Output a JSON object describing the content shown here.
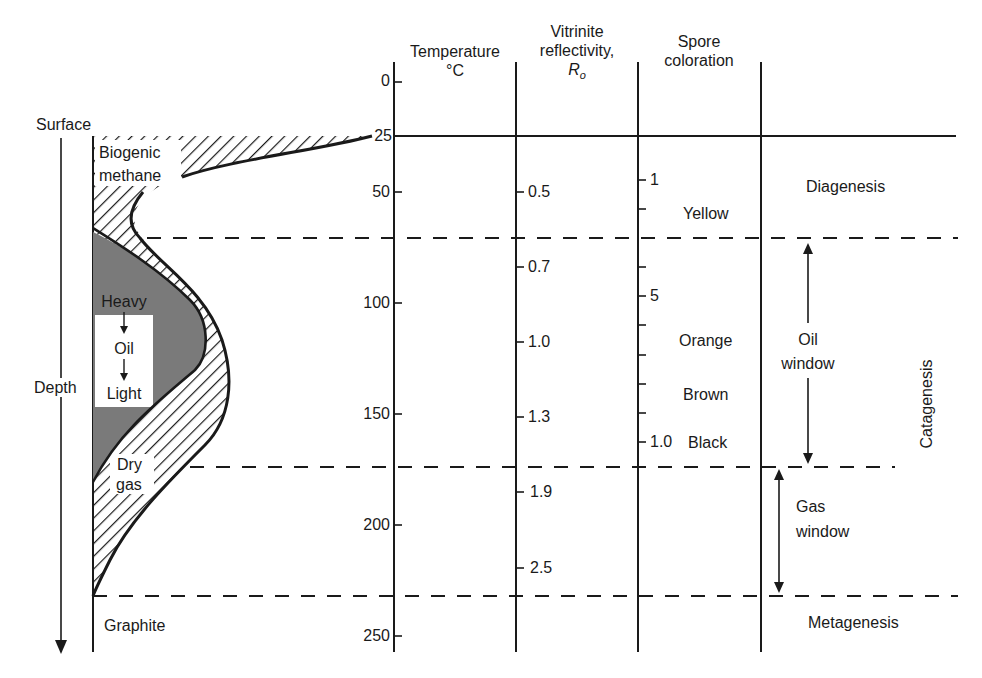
{
  "left_panel": {
    "surface_label": "Surface",
    "depth_label": "Depth",
    "biogenic_label": [
      "Biogenic",
      "methane"
    ],
    "oil_labels": [
      "Heavy",
      "Oil",
      "Light"
    ],
    "dry_gas_label": [
      "Dry",
      "gas"
    ],
    "graphite_label": "Graphite"
  },
  "columns": {
    "temperature": {
      "header": "Temperature",
      "unit": "°C"
    },
    "vitrinite": {
      "header_line1": "Vitrinite",
      "header_line2": "reflectivity,",
      "symbol": "R",
      "subscript": "o"
    },
    "spore": {
      "header_line1": "Spore",
      "header_line2": "coloration"
    }
  },
  "temperature_ticks": [
    "0",
    "25",
    "50",
    "100",
    "150",
    "200",
    "250"
  ],
  "vitrinite_ticks": [
    "0.5",
    "0.7",
    "1.0",
    "1.3",
    "1.9",
    "2.5"
  ],
  "spore_ticks": [
    "1",
    "5",
    "1.0"
  ],
  "spore_colors": [
    "Yellow",
    "Orange",
    "Brown",
    "Black"
  ],
  "zones": {
    "diagenesis": "Diagenesis",
    "oil_window": [
      "Oil",
      "window"
    ],
    "catagenesis": "Catagenesis",
    "gas_window": [
      "Gas",
      "window"
    ],
    "metagenesis": "Metagenesis"
  },
  "colors": {
    "ink": "#1a1a1a",
    "oil_fill": "#7a7a7a",
    "background": "#ffffff"
  }
}
